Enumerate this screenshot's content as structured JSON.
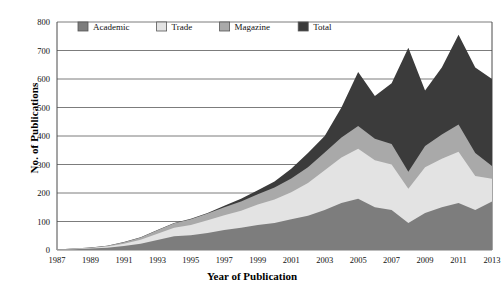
{
  "chart_data": {
    "type": "area",
    "stacked": true,
    "title": "",
    "xlabel": "Year of Publication",
    "ylabel": "No. of Publications",
    "x": [
      1987,
      1988,
      1989,
      1990,
      1991,
      1992,
      1993,
      1994,
      1995,
      1996,
      1997,
      1998,
      1999,
      2000,
      2001,
      2002,
      2003,
      2004,
      2005,
      2006,
      2007,
      2008,
      2009,
      2010,
      2011,
      2012,
      2013
    ],
    "tick_labels_x": [
      "1987",
      "1989",
      "1991",
      "1993",
      "1995",
      "1997",
      "1999",
      "2001",
      "2003",
      "2005",
      "2007",
      "2009",
      "2011",
      "2013"
    ],
    "tick_values_y": [
      0,
      100,
      200,
      300,
      400,
      500,
      600,
      700,
      800
    ],
    "ylim": [
      0,
      800
    ],
    "xlim": [
      1987,
      2013
    ],
    "grid": true,
    "legend_position": "top-left",
    "series": [
      {
        "name": "Academic",
        "color": "#7d7d7d",
        "values": [
          2,
          3,
          5,
          8,
          14,
          22,
          35,
          48,
          52,
          60,
          70,
          78,
          88,
          95,
          108,
          120,
          140,
          165,
          180,
          150,
          140,
          95,
          130,
          150,
          165,
          140,
          170
        ]
      },
      {
        "name": "Trade",
        "color": "#e3e3e3",
        "values": [
          0,
          1,
          2,
          4,
          8,
          14,
          22,
          30,
          36,
          44,
          52,
          60,
          72,
          82,
          95,
          115,
          140,
          160,
          175,
          165,
          160,
          120,
          160,
          170,
          180,
          120,
          80
        ]
      },
      {
        "name": "Magazine",
        "color": "#a9a9a9",
        "values": [
          0,
          1,
          1,
          3,
          5,
          8,
          12,
          16,
          20,
          24,
          28,
          32,
          36,
          42,
          48,
          55,
          62,
          70,
          80,
          75,
          72,
          60,
          75,
          85,
          95,
          80,
          45
        ]
      },
      {
        "name": "Total",
        "color": "#3b3b3b",
        "values": [
          2,
          5,
          9,
          15,
          28,
          45,
          70,
          95,
          110,
          130,
          155,
          180,
          210,
          240,
          285,
          340,
          400,
          500,
          625,
          540,
          585,
          710,
          560,
          640,
          755,
          640,
          600
        ]
      }
    ]
  },
  "legend": {
    "items": [
      {
        "label": "Academic",
        "color": "#7d7d7d"
      },
      {
        "label": "Trade",
        "color": "#e3e3e3"
      },
      {
        "label": "Magazine",
        "color": "#a9a9a9"
      },
      {
        "label": "Total",
        "color": "#3b3b3b"
      }
    ]
  }
}
